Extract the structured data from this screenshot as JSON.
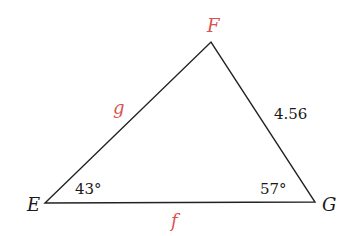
{
  "diagram": {
    "type": "triangle",
    "colors": {
      "line": "#222222",
      "red_label": "#d9534f",
      "black_label": "#1a1a1a"
    },
    "vertices": {
      "E": {
        "label": "E",
        "x": 45,
        "y": 203,
        "color": "black"
      },
      "F": {
        "label": "F",
        "x": 211,
        "y": 42,
        "color": "red"
      },
      "G": {
        "label": "G",
        "x": 315,
        "y": 202,
        "color": "black"
      }
    },
    "sides": {
      "g": {
        "label": "g",
        "between": [
          "E",
          "F"
        ],
        "color": "red"
      },
      "FG": {
        "label": "4.56",
        "between": [
          "F",
          "G"
        ],
        "color": "black"
      },
      "f": {
        "label": "f",
        "between": [
          "E",
          "G"
        ],
        "color": "red"
      }
    },
    "angles": {
      "E": {
        "label": "43°"
      },
      "G": {
        "label": "57°"
      }
    }
  }
}
